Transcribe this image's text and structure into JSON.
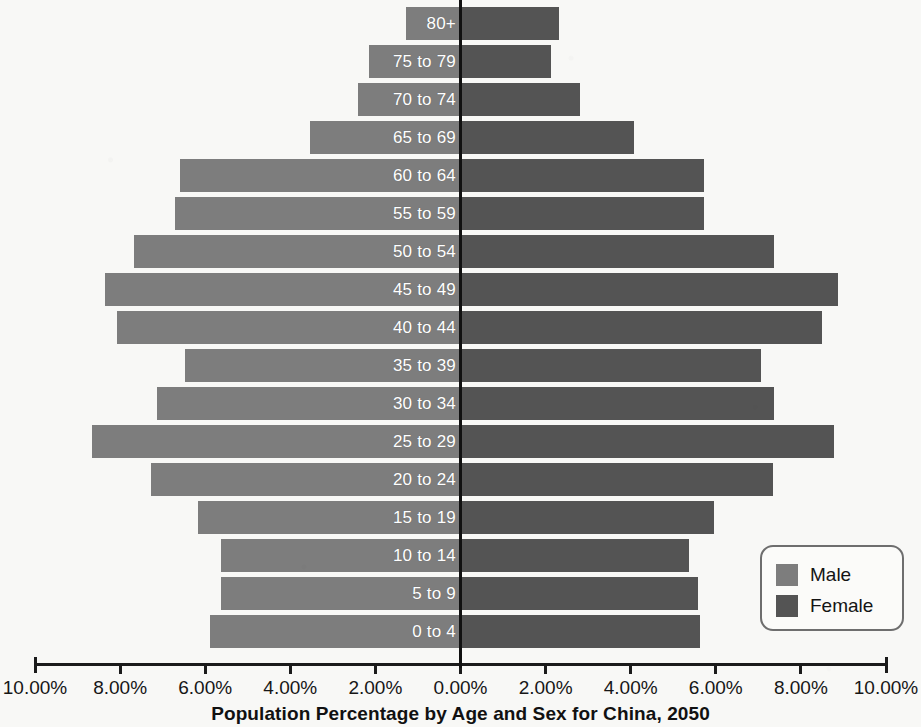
{
  "chart_data": {
    "type": "bar",
    "subtype": "population-pyramid",
    "title": "Population Percentage by Age and Sex for China, 2050",
    "xlabel": "",
    "ylabel": "",
    "xlim": [
      -10,
      10
    ],
    "xtick_values": [
      -10,
      -8,
      -6,
      -4,
      -2,
      0,
      2,
      4,
      6,
      8,
      10
    ],
    "xtick_labels": [
      "10.00%",
      "8.00%",
      "6.00%",
      "4.00%",
      "2.00%",
      "0.00%",
      "2.00%",
      "4.00%",
      "6.00%",
      "8.00%",
      "10.00%"
    ],
    "grid": false,
    "legend_position": "bottom-right",
    "categories": [
      "80+",
      "75 to 79",
      "70 to 74",
      "65 to 69",
      "60 to 64",
      "55 to 59",
      "50 to 54",
      "45 to 49",
      "40 to 44",
      "35 to 39",
      "30 to 34",
      "25 to 29",
      "20 to 24",
      "15 to 19",
      "10 to 14",
      "5 to 9",
      "0 to 4"
    ],
    "series": [
      {
        "name": "Male",
        "color": "#7d7d7d",
        "direction": "left",
        "values": [
          1.29,
          2.14,
          2.42,
          3.53,
          6.6,
          6.7,
          7.67,
          8.35,
          8.07,
          6.47,
          7.13,
          8.66,
          7.27,
          6.16,
          5.62,
          5.62,
          5.88
        ]
      },
      {
        "name": "Female",
        "color": "#545454",
        "direction": "right",
        "values": [
          2.31,
          2.12,
          2.82,
          4.07,
          5.72,
          5.72,
          7.36,
          8.87,
          8.5,
          7.06,
          7.36,
          8.78,
          7.34,
          5.95,
          5.36,
          5.58,
          5.62
        ]
      }
    ]
  },
  "legend": {
    "items": [
      {
        "label": "Male",
        "color": "#7d7d7d"
      },
      {
        "label": "Female",
        "color": "#545454"
      }
    ]
  },
  "colors": {
    "male": "#7d7d7d",
    "female": "#545454",
    "axis": "#1b1b1b",
    "zero_line": "#111111",
    "background": "#f8f8f6",
    "label_text": "#ffffff"
  }
}
